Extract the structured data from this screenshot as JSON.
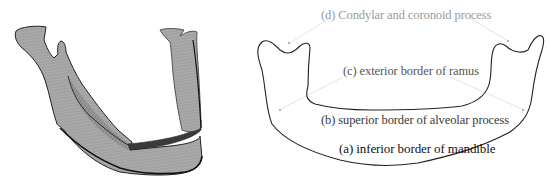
{
  "figure": {
    "left_panel": {
      "description": "3D rendered mandible (grayscale)",
      "colors": {
        "bone_fill": "#a9a9a9",
        "bone_light": "#c4c4c4",
        "hatching": "#6a6a6a",
        "inner_band": "#3a3a3a",
        "outline": "#1a1a1a"
      }
    },
    "right_panel": {
      "description": "Mandible outline with labeled borders",
      "outline_color": "#222222",
      "leader_color": "#d8d8d8",
      "labels": {
        "d": "(d) Condylar and coronoid process",
        "c": "(c) exterior border of ramus",
        "b": "(b) superior border of alveolar process",
        "a": "(a) inferior border of mandible"
      },
      "label_colors": {
        "d": "#9a9a9a",
        "c": "#555555",
        "b": "#3a3a3a",
        "a": "#111111"
      }
    }
  }
}
